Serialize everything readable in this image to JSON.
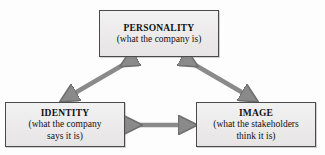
{
  "diagram": {
    "arrow_color": "#8a8a8a",
    "arrow_edge_color": "#6f6f6f",
    "box_fill_color": "#ecebeb",
    "box_border_color": "#4a4a4a",
    "text_color": "#111111",
    "background_color": "#fdfdfd",
    "nodes": [
      {
        "id": "personality",
        "title": "PERSONALITY",
        "subtitle": "(what the company is)"
      },
      {
        "id": "identity",
        "title": "IDENTITY",
        "subtitle": "(what the company\nsays it is)"
      },
      {
        "id": "image",
        "title": "IMAGE",
        "subtitle": "(what the stakeholders\nthink it is)"
      }
    ],
    "connectors": [
      {
        "id": "personality-identity",
        "from": "personality",
        "to": "identity",
        "style": "double-headed-arrow",
        "orientation": "diagonal-left"
      },
      {
        "id": "personality-image",
        "from": "personality",
        "to": "image",
        "style": "double-headed-arrow",
        "orientation": "diagonal-right"
      },
      {
        "id": "identity-image",
        "from": "identity",
        "to": "image",
        "style": "double-headed-arrow",
        "orientation": "horizontal"
      }
    ]
  }
}
